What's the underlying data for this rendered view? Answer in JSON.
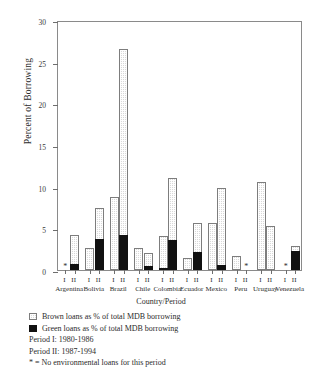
{
  "chart_data": {
    "type": "bar",
    "title": "",
    "xlabel": "Country/Period",
    "ylabel": "Percent of Borrowing",
    "ylim": [
      0,
      30
    ],
    "yticks": [
      0,
      5,
      10,
      15,
      20,
      25,
      30
    ],
    "grid": false,
    "legend_position": "below-axes",
    "categories": [
      "Argentina",
      "Bolivia",
      "Brazil",
      "Chile",
      "Colombia",
      "Ecuador",
      "Mexico",
      "Peru",
      "Uruguay",
      "Venezuela"
    ],
    "period_labels": [
      "I",
      "II"
    ],
    "series": [
      {
        "name": "Brown loans as % of total MDB borrowing",
        "pattern": "stippled",
        "color": "#d9d9d9",
        "values_period_I": [
          null,
          2.6,
          8.8,
          2.6,
          4.1,
          1.5,
          5.6,
          1.7,
          10.6,
          null
        ],
        "values_period_II": [
          4.2,
          7.5,
          26.5,
          2.0,
          11.0,
          5.6,
          9.9,
          null,
          5.3,
          2.9
        ]
      },
      {
        "name": "Green loans as % of total MDB borrowing",
        "pattern": "solid",
        "color": "#111111",
        "values_period_I": [
          null,
          0.0,
          0.0,
          0.0,
          0.3,
          0.0,
          0.0,
          0.0,
          0.0,
          null
        ],
        "values_period_II": [
          0.7,
          3.7,
          4.2,
          0.5,
          3.6,
          2.2,
          0.6,
          null,
          0.0,
          2.3
        ]
      }
    ],
    "no_data_marker": "*",
    "no_data_cells": [
      {
        "country": "Argentina",
        "period": "I"
      },
      {
        "country": "Peru",
        "period": "II"
      },
      {
        "country": "Venezuela",
        "period": "I"
      }
    ],
    "annotations": [
      "Period I: 1980-1986",
      "Period II: 1987-1994",
      "* = No environmental loans for this period"
    ]
  },
  "legend": {
    "brown_label": "Brown loans as % of total MDB borrowing",
    "green_label": "Green loans as % of total MDB borrowing",
    "period_i": "Period I: 1980-1986",
    "period_ii": "Period II:  1987-1994",
    "footnote": "* = No environmental loans for this period"
  }
}
